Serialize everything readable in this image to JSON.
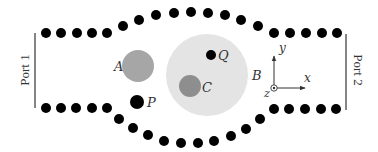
{
  "diagram": {
    "type": "waveguide-cavity-schematic",
    "background": "#ffffff",
    "rod_color": "#000000",
    "rod_radius": 5,
    "ports": [
      {
        "label": "Port 1",
        "x": 35,
        "y1": 33,
        "y2": 108,
        "text_x": 26,
        "text_y": 70,
        "rotation": -90
      },
      {
        "label": "Port 2",
        "x": 346,
        "y1": 34,
        "y2": 110,
        "text_x": 357,
        "text_y": 70,
        "rotation": 90
      }
    ],
    "rods_top": [
      [
        46,
        33
      ],
      [
        61,
        33
      ],
      [
        77,
        33
      ],
      [
        92,
        33
      ],
      [
        107,
        33
      ],
      [
        123,
        26
      ],
      [
        139,
        20
      ],
      [
        156,
        15
      ],
      [
        174,
        13
      ],
      [
        191,
        12
      ],
      [
        208,
        13
      ],
      [
        225,
        15
      ],
      [
        241,
        20
      ],
      [
        258,
        26
      ],
      [
        274,
        33
      ],
      [
        290,
        33
      ],
      [
        306,
        33
      ],
      [
        322,
        33
      ],
      [
        337,
        33
      ]
    ],
    "rods_bottom": [
      [
        46,
        108
      ],
      [
        61,
        108
      ],
      [
        76,
        108
      ],
      [
        92,
        108
      ],
      [
        107,
        108
      ],
      [
        119,
        119
      ],
      [
        133,
        128
      ],
      [
        148,
        135
      ],
      [
        164,
        141
      ],
      [
        181,
        143
      ],
      [
        198,
        143
      ],
      [
        214,
        141
      ],
      [
        231,
        136
      ],
      [
        246,
        129
      ],
      [
        260,
        119
      ],
      [
        274,
        109
      ],
      [
        289,
        109
      ],
      [
        305,
        109
      ],
      [
        321,
        109
      ],
      [
        336,
        109
      ]
    ],
    "regions": [
      {
        "name": "B",
        "cx": 207,
        "cy": 75,
        "r": 41,
        "fill": "#e4e4e4",
        "label": "B",
        "label_x": 252,
        "label_y": 80
      },
      {
        "name": "A",
        "cx": 138,
        "cy": 66,
        "r": 16,
        "fill": "#a6a6a6",
        "label": "A",
        "label_x": 114,
        "label_y": 71
      },
      {
        "name": "C",
        "cx": 190,
        "cy": 86,
        "r": 11,
        "fill": "#8e8e8e",
        "label": "C",
        "label_x": 202,
        "label_y": 92
      }
    ],
    "points": [
      {
        "name": "P",
        "cx": 137,
        "cy": 102,
        "r": 7,
        "fill": "#000000",
        "label": "P",
        "label_x": 147,
        "label_y": 107
      },
      {
        "name": "Q",
        "cx": 211,
        "cy": 55,
        "r": 5,
        "fill": "#000000",
        "label": "Q",
        "label_x": 218,
        "label_y": 60
      }
    ],
    "axes": {
      "origin": [
        274,
        88
      ],
      "x_end": [
        305,
        88
      ],
      "y_end": [
        274,
        56
      ],
      "x_label": "x",
      "x_label_pos": [
        304,
        82
      ],
      "y_label": "y",
      "y_label_pos": [
        279,
        52
      ],
      "z_label": "z",
      "z_label_pos": [
        264,
        97
      ],
      "color": "#333333"
    }
  }
}
